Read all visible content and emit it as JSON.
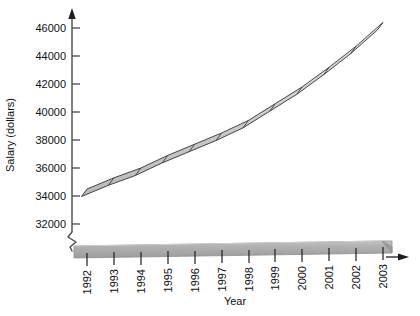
{
  "chart_data": {
    "type": "line",
    "title": "",
    "xlabel": "Year",
    "ylabel": "Salary (dollars)",
    "categories": [
      "1992",
      "1993",
      "1994",
      "1995",
      "1996",
      "1997",
      "1998",
      "1999",
      "2000",
      "2001",
      "2002",
      "2003"
    ],
    "values": [
      34500,
      35300,
      36000,
      36900,
      37700,
      38500,
      39400,
      40600,
      41800,
      43200,
      44700,
      46400
    ],
    "series": [
      {
        "name": "Salary",
        "values": [
          34500,
          35300,
          36000,
          36900,
          37700,
          38500,
          39400,
          40600,
          41800,
          43200,
          44700,
          46400
        ]
      }
    ],
    "ylim": [
      32000,
      46000
    ],
    "ytick_labels": [
      "32000",
      "34000",
      "36000",
      "38000",
      "40000",
      "42000",
      "44000",
      "46000"
    ],
    "ytick_values": [
      32000,
      34000,
      36000,
      38000,
      40000,
      42000,
      44000,
      46000
    ],
    "xtick_labels": [
      "1992",
      "1993",
      "1994",
      "1995",
      "1996",
      "1997",
      "1998",
      "1999",
      "2000",
      "2001",
      "2002",
      "2003"
    ],
    "grid": false,
    "legend": "none",
    "axis_break": true,
    "style": "3d-ribbon"
  },
  "colors": {
    "ribbon_fill": "#c8c8c8",
    "ribbon_fill_light": "#dcdcdc",
    "ribbon_stroke": "#2b2b2b",
    "axis": "#4a4a4a",
    "baseline_slab": "#a8a8a8",
    "baseline_slab_top": "#bcbcbc",
    "text": "#111111",
    "background": "#ffffff"
  },
  "axis_labels": {
    "y_title": "Salary (dollars)",
    "x_title": "Year"
  }
}
